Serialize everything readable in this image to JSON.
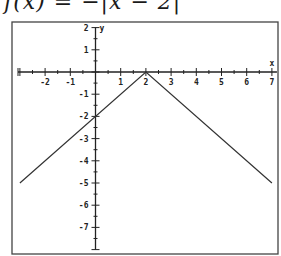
{
  "title": "f(x) = −|x − 2|",
  "chart_data": {
    "type": "line",
    "title": "f(x) = −|x − 2|",
    "xlabel": "x",
    "ylabel": "y",
    "xlim": [
      -3.1,
      7.2
    ],
    "ylim": [
      -8,
      2
    ],
    "grid": false,
    "x_ticks": [
      -2,
      -1,
      1,
      2,
      3,
      4,
      5,
      6,
      7
    ],
    "y_ticks": [
      2,
      1,
      -1,
      -2,
      -3,
      -4,
      -5,
      -6,
      -7
    ],
    "series": [
      {
        "name": "f(x) = -|x - 2|",
        "x": [
          -3,
          2,
          7
        ],
        "y": [
          -5,
          0,
          -5
        ]
      }
    ]
  },
  "layout": {
    "frame": {
      "left": 12,
      "top": 22,
      "right": 278,
      "bottom": 254
    },
    "origin_px": {
      "x": 95.5,
      "y": 72
    },
    "unit_px": {
      "x": 25.2,
      "y": 22.2
    },
    "line_color": "#333333",
    "axis_color": "#222222",
    "frame_color": "#444444"
  }
}
